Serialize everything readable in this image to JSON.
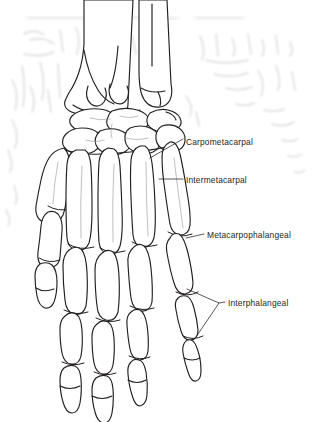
{
  "figure": {
    "view": "dorsal / posterior view of right hand",
    "ink_color": "#231f20",
    "background_color": "#ffffff",
    "bleed_through_color": "#d8d6d4",
    "labels": [
      {
        "id": "carpometacarpal",
        "text": "Carpometacarpal"
      },
      {
        "id": "intermetacarpal",
        "text": "Intermetacarpal"
      },
      {
        "id": "metacarpophalangeal",
        "text": "Metacarpophalangeal"
      },
      {
        "id": "interphalangeal",
        "text": "Interphalangeal"
      }
    ],
    "bones": [
      {
        "id": "radius",
        "name": "radius"
      },
      {
        "id": "ulna",
        "name": "ulna"
      },
      {
        "id": "carpals",
        "name": "carpal bones"
      },
      {
        "id": "metacarpals",
        "name": "metacarpal bones"
      },
      {
        "id": "proximal-phalanges",
        "name": "proximal phalanges"
      },
      {
        "id": "middle-phalanges",
        "name": "middle phalanges"
      },
      {
        "id": "distal-phalanges",
        "name": "distal phalanges"
      }
    ]
  }
}
